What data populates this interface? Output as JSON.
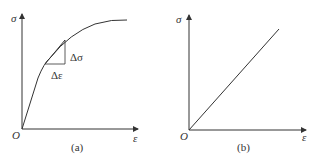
{
  "panels": [
    {
      "id": "a",
      "caption": "(a)",
      "y_axis_label": "σ",
      "x_axis_label": "ε",
      "origin_label": "O",
      "delta_sigma_label": "Δσ",
      "delta_epsilon_label": "Δε",
      "curve": "nonlinear stress-strain curve with tangent triangle"
    },
    {
      "id": "b",
      "caption": "(b)",
      "y_axis_label": "σ",
      "x_axis_label": "ε",
      "origin_label": "O",
      "curve": "linear stress-strain line"
    }
  ],
  "colors": {
    "line": "#333333",
    "background": "#ffffff"
  }
}
